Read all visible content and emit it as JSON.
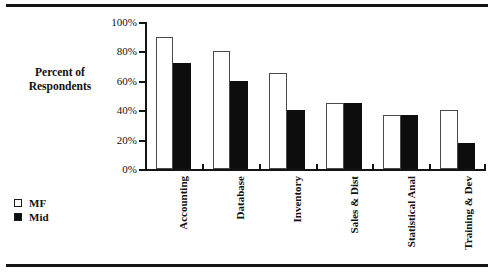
{
  "page": {
    "rule_top": "horizontal-rule",
    "rule_bottom": "horizontal-rule",
    "ghost_text": "................................................................"
  },
  "chart_data": {
    "type": "bar",
    "title": "",
    "subtitle": "",
    "xlabel": "",
    "ylabel": "Percent of Respondents",
    "ylim": [
      0,
      100
    ],
    "grid": false,
    "legend_position": "bottom-left",
    "categories": [
      "Accounting",
      "Database",
      "Inventory",
      "Sales & Dist",
      "Statistical Anal",
      "Training & Dev"
    ],
    "ytick_labels": [
      "100%",
      "80%",
      "60%",
      "40%",
      "20%",
      "0%"
    ],
    "ytick_values": [
      100,
      80,
      60,
      40,
      20,
      0
    ],
    "series": [
      {
        "name": "MF",
        "color": "#ffffff",
        "values": [
          90,
          80,
          65,
          45,
          37,
          40
        ]
      },
      {
        "name": "Mid",
        "color": "#0d0d0d",
        "values": [
          72,
          60,
          40,
          45,
          37,
          18
        ]
      }
    ]
  },
  "legend": {
    "items": [
      {
        "label": "MF"
      },
      {
        "label": "Mid"
      }
    ]
  }
}
